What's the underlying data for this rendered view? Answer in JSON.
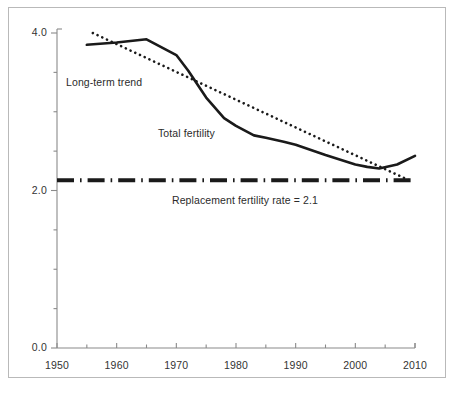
{
  "figure": {
    "background": "#ffffff",
    "frame_color": "#b9b9b9",
    "axis_color": "#8a8a8a",
    "ink_color": "#1a1a1a"
  },
  "chart_data": {
    "type": "line",
    "title": "",
    "subtitle": "",
    "xlabel": "",
    "ylabel": "",
    "xlim": [
      1950,
      2010
    ],
    "ylim": [
      0.0,
      4.0
    ],
    "grid": false,
    "legend_position": "inline-annotations",
    "x_ticks_major": [
      1950,
      1960,
      1970,
      1980,
      1990,
      2000,
      2010
    ],
    "x_tick_labels": [
      "1950",
      "1960",
      "1970",
      "1980",
      "1990",
      "2000",
      "2010"
    ],
    "x_ticks_minor": [
      1955,
      1965,
      1975,
      1985,
      1995,
      2005
    ],
    "y_ticks_major": [
      0.0,
      2.0,
      4.0
    ],
    "y_tick_labels": [
      "0.0",
      "2.0",
      "4.0"
    ],
    "y_ticks_minor": [
      0.5,
      1.0,
      1.5,
      2.5,
      3.0,
      3.5
    ],
    "series": [
      {
        "name": "Total fertility",
        "style": "solid",
        "color": "#1a1a1a",
        "width": 2.6,
        "x": [
          1955,
          1960,
          1965,
          1970,
          1972,
          1975,
          1978,
          1980,
          1983,
          1985,
          1988,
          1990,
          1995,
          2000,
          2002,
          2004,
          2007,
          2010
        ],
        "values": [
          3.85,
          3.88,
          3.92,
          3.72,
          3.52,
          3.18,
          2.92,
          2.82,
          2.7,
          2.67,
          2.62,
          2.58,
          2.45,
          2.33,
          2.3,
          2.28,
          2.33,
          2.44
        ]
      },
      {
        "name": "Long-term trend",
        "style": "dotted",
        "color": "#1a1a1a",
        "width": 2.6,
        "x": [
          1956,
          2009
        ],
        "values": [
          4.0,
          2.13
        ]
      },
      {
        "name": "Replacement fertility rate = 2.1",
        "style": "dash-dot",
        "color": "#1a1a1a",
        "width": 4.0,
        "x": [
          1950,
          2010
        ],
        "values": [
          2.13,
          2.13
        ]
      }
    ],
    "annotations": [
      {
        "text": "Long-term trend",
        "x": 1957.5,
        "y": 3.35
      },
      {
        "text": "Total fertility",
        "x": 1972.5,
        "y": 2.88
      },
      {
        "text": "Replacement fertility rate = 2.1",
        "x": 1983.5,
        "y": 1.82
      }
    ]
  }
}
